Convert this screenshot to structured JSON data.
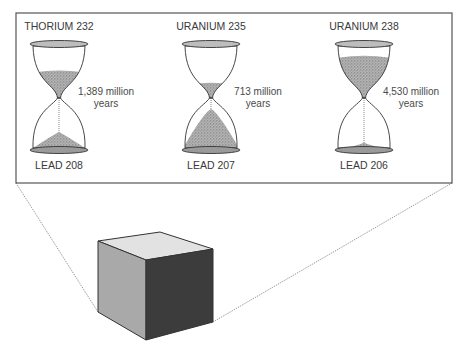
{
  "colors": {
    "frame": "#555555",
    "sand": "#8a8a8a",
    "cube_top": "#e2e2e2",
    "cube_left": "#a9a9a9",
    "cube_right": "#3c3c3c"
  },
  "hourglasses": [
    {
      "parent": "THORIUM 232",
      "daughter": "LEAD 208",
      "half_life_line1": "1,389 million",
      "half_life_line2": "years",
      "top_fill": 0.55,
      "bottom_fill": 0.35
    },
    {
      "parent": "URANIUM 235",
      "daughter": "LEAD 207",
      "half_life_line1": "713 million",
      "half_life_line2": "years",
      "top_fill": 0.3,
      "bottom_fill": 0.85
    },
    {
      "parent": "URANIUM 238",
      "daughter": "LEAD 206",
      "half_life_line1": "4,530 million",
      "half_life_line2": "years",
      "top_fill": 0.85,
      "bottom_fill": 0.12
    }
  ]
}
